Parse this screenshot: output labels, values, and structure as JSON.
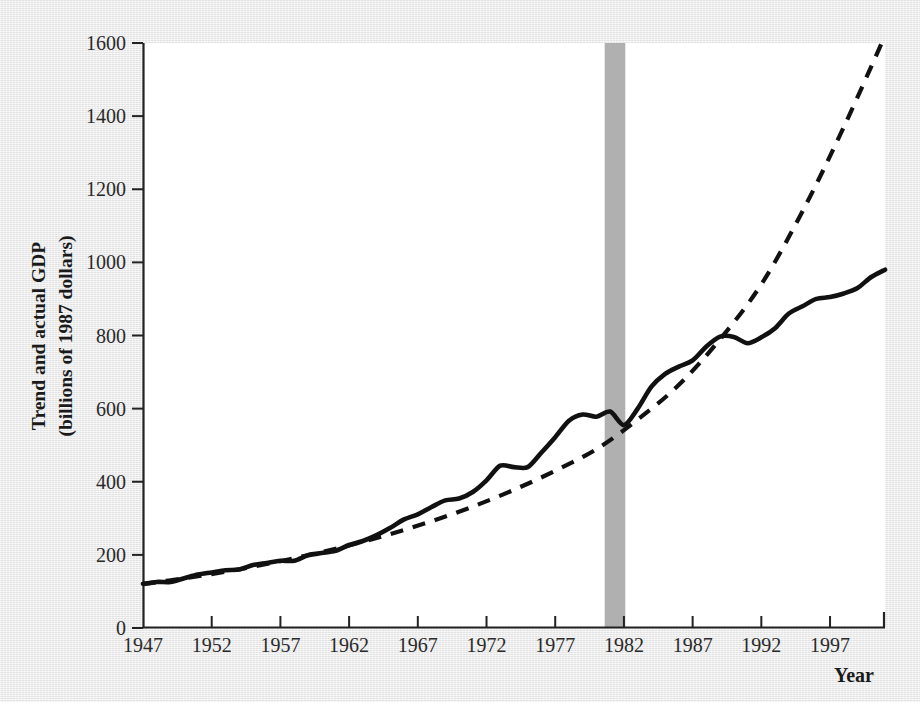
{
  "chart_data": {
    "type": "line",
    "title": "",
    "xlabel": "Year",
    "ylabel": "Trend and actual GDP (billions of 1987 dollars)",
    "ylabel_line1": "Trend and actual GDP",
    "ylabel_line2": "(billions of 1987 dollars)",
    "xlim": [
      1947,
      2001
    ],
    "ylim": [
      0,
      1600
    ],
    "grid": false,
    "legend": "none",
    "x_ticks": [
      1947,
      1952,
      1957,
      1962,
      1967,
      1972,
      1977,
      1982,
      1987,
      1992,
      1997
    ],
    "x_tick_labels": [
      "1947",
      "1952",
      "1957",
      "1962",
      "1967",
      "1972",
      "1977",
      "1982",
      "1987",
      "1992",
      "1997"
    ],
    "y_ticks": [
      0,
      200,
      400,
      600,
      800,
      1000,
      1200,
      1400,
      1600
    ],
    "y_tick_labels": [
      "0",
      "200",
      "400",
      "600",
      "800",
      "1000",
      "1200",
      "1400",
      "1600"
    ],
    "shaded_regions": [
      {
        "name": "recession-band",
        "x_start": 1980.6,
        "x_end": 1982.1,
        "color": "#b0b0b0"
      }
    ],
    "series": [
      {
        "name": "Actual GDP",
        "style": "solid",
        "color": "#111111",
        "x": [
          1947,
          1948,
          1949,
          1950,
          1951,
          1952,
          1953,
          1954,
          1955,
          1956,
          1957,
          1958,
          1959,
          1960,
          1961,
          1962,
          1963,
          1964,
          1965,
          1966,
          1967,
          1968,
          1969,
          1970,
          1971,
          1972,
          1973,
          1974,
          1975,
          1976,
          1977,
          1978,
          1979,
          1980,
          1981,
          1982,
          1983,
          1984,
          1985,
          1986,
          1987,
          1988,
          1989,
          1990,
          1991,
          1992,
          1993,
          1994,
          1995,
          1996,
          1997,
          1998,
          1999,
          2000,
          2001
        ],
        "values": [
          121,
          126,
          126,
          136,
          146,
          152,
          158,
          160,
          172,
          178,
          184,
          184,
          199,
          205,
          211,
          227,
          238,
          254,
          274,
          297,
          311,
          331,
          349,
          354,
          372,
          404,
          444,
          440,
          440,
          480,
          522,
          567,
          584,
          578,
          592,
          555,
          600,
          660,
          695,
          715,
          732,
          770,
          797,
          796,
          779,
          795,
          820,
          860,
          880,
          900,
          905,
          915,
          930,
          960,
          980
        ]
      },
      {
        "name": "Trend GDP",
        "style": "dashed",
        "color": "#111111",
        "x": [
          1947,
          1950,
          1953,
          1956,
          1959,
          1962,
          1965,
          1968,
          1971,
          1974,
          1977,
          1980,
          1983,
          1986,
          1989,
          1992,
          1995,
          1998,
          2001
        ],
        "values": [
          120,
          136,
          154,
          175,
          199,
          226,
          257,
          292,
          332,
          378,
          430,
          489,
          570,
          665,
          790,
          940,
          1140,
          1370,
          1620
        ]
      }
    ],
    "notes": {
      "description": "Actual GDP (solid) tracks trend GDP (dashed) closely through 1980, then falls persistently below trend after the 1981-82 recession (gray band).",
      "crossover_year": 1981
    }
  },
  "colors": {
    "page_background": "#e9e9e9",
    "plot_background": "#ffffff",
    "line": "#111111",
    "axis": "#222222",
    "recession_band": "#b0b0b0"
  }
}
